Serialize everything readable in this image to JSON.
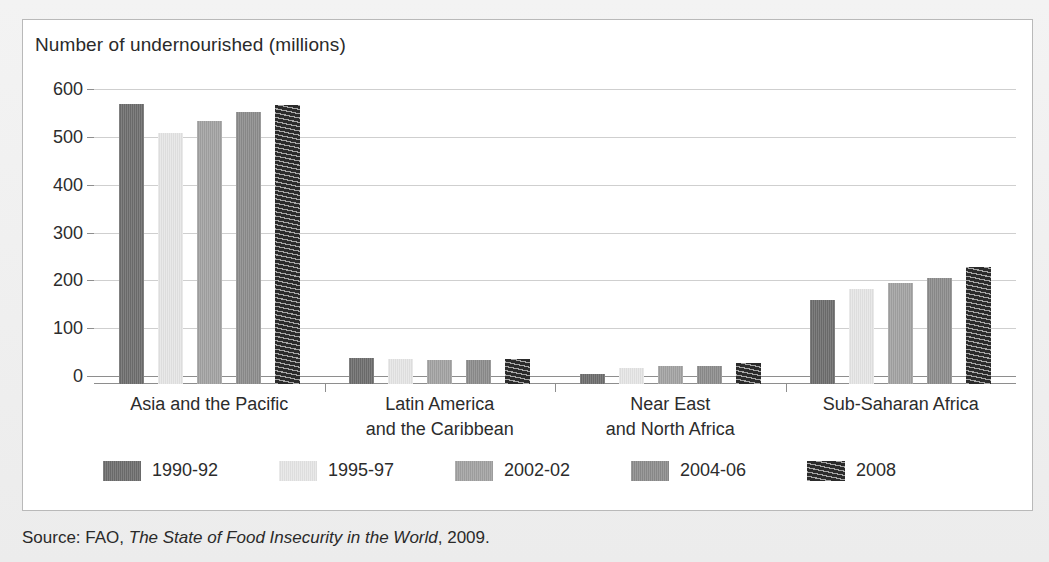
{
  "chart_data": {
    "type": "bar",
    "title": "Number of undernourished (millions)",
    "xlabel": "",
    "ylabel": "",
    "ylim": [
      0,
      600
    ],
    "yticks": [
      0,
      100,
      200,
      300,
      400,
      500,
      600
    ],
    "grid": true,
    "legend_position": "bottom",
    "categories": [
      "Asia and the Pacific",
      "Latin America\nand the Caribbean",
      "Near East\nand North Africa",
      "Sub-Saharan Africa"
    ],
    "category_lines": [
      [
        "Asia and the Pacific"
      ],
      [
        "Latin America",
        "and the Caribbean"
      ],
      [
        "Near East",
        "and North Africa"
      ],
      [
        "Sub-Saharan Africa"
      ]
    ],
    "series": [
      {
        "name": "1990-92",
        "color": "#6d6d6d",
        "values": [
          585,
          54,
          20,
          175
        ]
      },
      {
        "name": "1995-97",
        "color": "#e6e6e6",
        "values": [
          525,
          53,
          33,
          198
        ]
      },
      {
        "name": "2002-02",
        "color": "#a2a2a2",
        "values": [
          550,
          50,
          37,
          212
        ]
      },
      {
        "name": "2004-06",
        "color": "#8c8c8c",
        "values": [
          568,
          50,
          38,
          222
        ]
      },
      {
        "name": "2008",
        "color": "#2b2b2b",
        "values": [
          583,
          52,
          43,
          245
        ]
      }
    ]
  },
  "source": {
    "prefix": "Source: FAO, ",
    "title": "The State of Food Insecurity in the World",
    "suffix": ", 2009."
  }
}
